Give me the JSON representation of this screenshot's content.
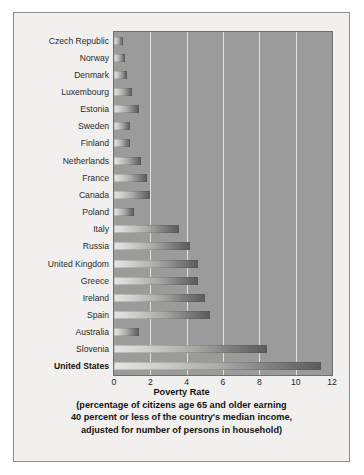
{
  "chart_data": {
    "type": "bar",
    "orientation": "horizontal",
    "title": "",
    "xlabel": "Poverty Rate",
    "ylabel": "",
    "xlim": [
      0,
      12
    ],
    "xticks": [
      0,
      2,
      4,
      6,
      8,
      10,
      12
    ],
    "grid": true,
    "gridlines": [
      2,
      4,
      6,
      8,
      10
    ],
    "legend": "none",
    "caption_lines": [
      "(percentage of citizens age 65 and older earning",
      "40 percent or less of the country's median income,",
      "adjusted for number of persons in household)"
    ],
    "categories": [
      "Czech Republic",
      "Norway",
      "Denmark",
      "Luxembourg",
      "Estonia",
      "Sweden",
      "Finland",
      "Netherlands",
      "France",
      "Canada",
      "Poland",
      "Italy",
      "Russia",
      "United Kingdom",
      "Greece",
      "Ireland",
      "Spain",
      "Australia",
      "Slovenia",
      "United States"
    ],
    "values": [
      0.5,
      0.6,
      0.7,
      1.0,
      1.4,
      0.9,
      0.9,
      1.5,
      1.8,
      2.0,
      1.1,
      3.6,
      4.2,
      4.6,
      4.6,
      5.0,
      5.3,
      1.4,
      8.4,
      11.4
    ],
    "highlighted_category": "United States",
    "colors": {
      "plot_background": "#9b9b9b",
      "panel_background": "#f1f0ee",
      "gridline": "#e9e8e4",
      "bar_light": "#e6e5e2",
      "bar_dark": "#5c5b59",
      "text": "#1f1f1f",
      "border": "#8d8d8d"
    }
  }
}
